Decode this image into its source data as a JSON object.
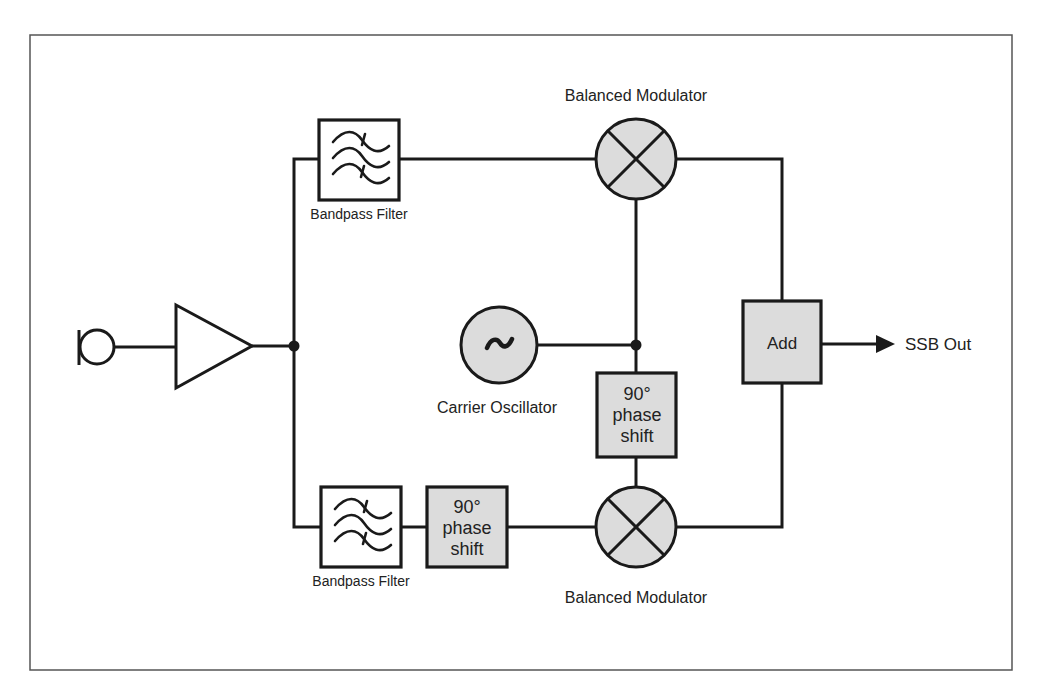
{
  "diagram": {
    "colors": {
      "line": "#1a1a1a",
      "block_fill": "#dcdcdc",
      "filter_fill": "#ffffff",
      "frame": "#555555",
      "text": "#222222"
    },
    "nodes": {
      "microphone": {
        "label": ""
      },
      "amplifier": {
        "label": ""
      },
      "bandpass_top": {
        "label": "Bandpass Filter",
        "icon": "bandpass-filter-icon"
      },
      "bandpass_bottom": {
        "label": "Bandpass Filter",
        "icon": "bandpass-filter-icon"
      },
      "modulator_top": {
        "label": "Balanced Modulator",
        "icon": "mixer-x-icon"
      },
      "modulator_bottom": {
        "label": "Balanced Modulator",
        "icon": "mixer-x-icon"
      },
      "oscillator": {
        "label": "Carrier Oscillator",
        "symbol": "~"
      },
      "phase_shift_carrier": {
        "line1": "90°",
        "line2": "phase",
        "line3": "shift"
      },
      "phase_shift_audio": {
        "line1": "90°",
        "line2": "phase",
        "line3": "shift"
      },
      "adder": {
        "label": "Add"
      },
      "output": {
        "label": "SSB Out"
      }
    },
    "edges": [
      [
        "microphone",
        "amplifier"
      ],
      [
        "amplifier",
        "junction_audio"
      ],
      [
        "junction_audio",
        "bandpass_top"
      ],
      [
        "junction_audio",
        "bandpass_bottom"
      ],
      [
        "bandpass_top",
        "modulator_top"
      ],
      [
        "bandpass_bottom",
        "phase_shift_audio"
      ],
      [
        "phase_shift_audio",
        "modulator_bottom"
      ],
      [
        "oscillator",
        "junction_carrier"
      ],
      [
        "junction_carrier",
        "modulator_top"
      ],
      [
        "junction_carrier",
        "phase_shift_carrier"
      ],
      [
        "phase_shift_carrier",
        "modulator_bottom"
      ],
      [
        "modulator_top",
        "adder"
      ],
      [
        "modulator_bottom",
        "adder"
      ],
      [
        "adder",
        "output"
      ]
    ]
  }
}
